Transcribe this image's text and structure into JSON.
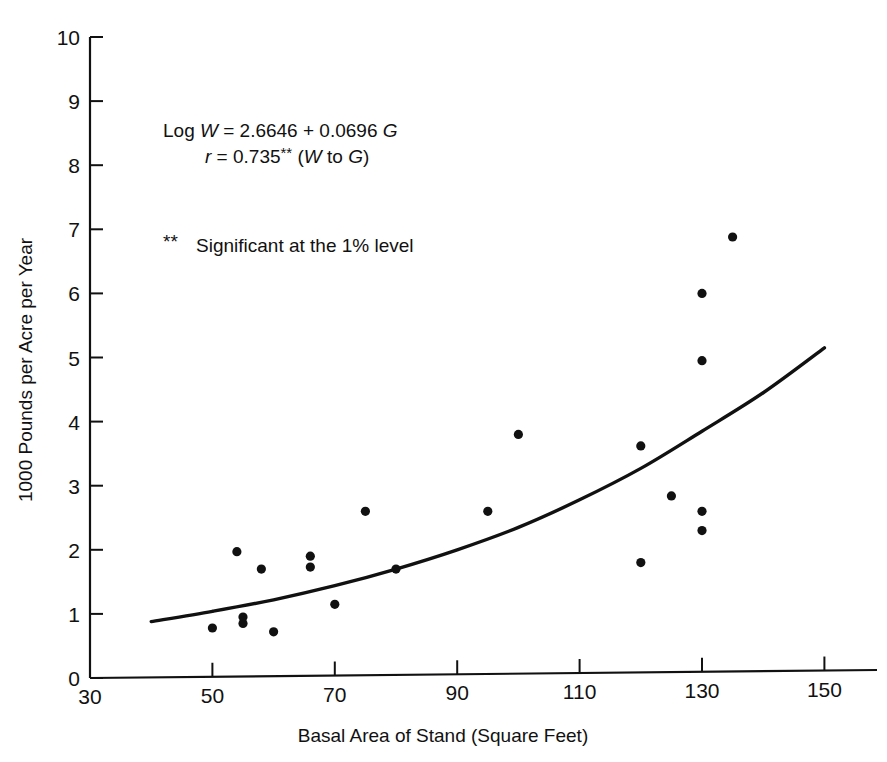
{
  "chart_data": {
    "type": "scatter",
    "title": "",
    "xlabel": "Basal Area of Stand (Square Feet)",
    "ylabel": "1000 Pounds per Acre per Year",
    "xlim": [
      30,
      155
    ],
    "ylim": [
      0,
      10
    ],
    "grid": false,
    "legend": "none",
    "xticks": [
      30,
      50,
      70,
      90,
      110,
      130,
      150
    ],
    "xtick_labels": [
      "30",
      "50",
      "70",
      "90",
      "110",
      "130",
      "150"
    ],
    "yticks": [
      0,
      1,
      2,
      3,
      4,
      5,
      6,
      7,
      8,
      9,
      10
    ],
    "ytick_labels": [
      "0",
      "1",
      "2",
      "3",
      "4",
      "5",
      "6",
      "7",
      "8",
      "9",
      "10"
    ],
    "points": [
      {
        "x": 50,
        "y": 0.78
      },
      {
        "x": 54,
        "y": 1.97
      },
      {
        "x": 55,
        "y": 0.95
      },
      {
        "x": 55,
        "y": 0.85
      },
      {
        "x": 58,
        "y": 1.7
      },
      {
        "x": 60,
        "y": 0.72
      },
      {
        "x": 66,
        "y": 1.9
      },
      {
        "x": 66,
        "y": 1.73
      },
      {
        "x": 70,
        "y": 1.15
      },
      {
        "x": 75,
        "y": 2.6
      },
      {
        "x": 80,
        "y": 1.7
      },
      {
        "x": 95,
        "y": 2.6
      },
      {
        "x": 100,
        "y": 3.8
      },
      {
        "x": 120,
        "y": 1.8
      },
      {
        "x": 120,
        "y": 3.62
      },
      {
        "x": 125,
        "y": 2.84
      },
      {
        "x": 130,
        "y": 2.6
      },
      {
        "x": 130,
        "y": 2.3
      },
      {
        "x": 130,
        "y": 4.95
      },
      {
        "x": 130,
        "y": 6.0
      },
      {
        "x": 135,
        "y": 6.88
      }
    ],
    "fit_curve": {
      "name": "Log W = 2.6646 + 0.0696 G",
      "x_start": 40,
      "x_end": 150,
      "y_start": 0.88,
      "y_end": 5.15,
      "samples": [
        {
          "x": 40,
          "y": 0.88
        },
        {
          "x": 50,
          "y": 1.04
        },
        {
          "x": 60,
          "y": 1.22
        },
        {
          "x": 70,
          "y": 1.44
        },
        {
          "x": 80,
          "y": 1.7
        },
        {
          "x": 90,
          "y": 2.0
        },
        {
          "x": 100,
          "y": 2.35
        },
        {
          "x": 110,
          "y": 2.78
        },
        {
          "x": 120,
          "y": 3.27
        },
        {
          "x": 130,
          "y": 3.85
        },
        {
          "x": 140,
          "y": 4.45
        },
        {
          "x": 150,
          "y": 5.15
        }
      ]
    },
    "annotations": {
      "equation_line1_prefix": "Log ",
      "equation_line1_var": "W",
      "equation_line1_rest": " =  2.6646 + 0.0696 ",
      "equation_line1_var2": "G",
      "equation_line2_var": "r",
      "equation_line2_eq": " =  0.735",
      "equation_line2_stars": "**",
      "equation_line2_paren_open": " (",
      "equation_line2_w": "W",
      "equation_line2_to": " to ",
      "equation_line2_g": "G",
      "equation_line2_paren_close": ")",
      "footnote_stars": "**",
      "footnote_text": "Significant at the 1% level"
    },
    "colors": {
      "axis": "#111111",
      "point": "#111111",
      "curve": "#111111",
      "background": "#ffffff"
    }
  }
}
